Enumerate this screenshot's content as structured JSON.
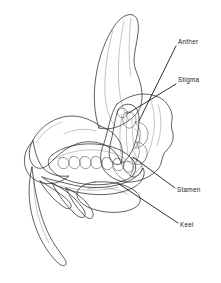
{
  "figure": {
    "background_color": "#ffffff",
    "width": 221,
    "height": 283,
    "style": "grayscale pen-and-ink botanical illustration"
  },
  "palette": {
    "ink": "#2b2b2b",
    "leader_line": "#0d0d0d",
    "label_text": "#1c1c1c",
    "light_gray": "#e8e8e8",
    "mid_gray": "#b9b9b9",
    "dark_gray": "#8a8a8a",
    "deep_gray": "#6a6a6a",
    "shadow_gray": "#4f4f4f",
    "paper": "#ffffff"
  },
  "labels": [
    {
      "id": "anther",
      "text": "Anther",
      "text_x": 178,
      "text_y": 44,
      "leader_from_x": 176,
      "leader_from_y": 46,
      "leader_to_x": 139,
      "leader_to_y": 121
    },
    {
      "id": "stigma",
      "text": "Stigma",
      "text_x": 178,
      "text_y": 82,
      "leader_from_x": 176,
      "leader_from_y": 84,
      "leader_to_x": 127,
      "leader_to_y": 114
    },
    {
      "id": "stamen",
      "text": "Stamen",
      "text_x": 177,
      "text_y": 192,
      "leader_from_x": 175,
      "leader_from_y": 188,
      "leader_to_x": 133,
      "leader_to_y": 157
    },
    {
      "id": "keel",
      "text": "Keel",
      "text_x": 180,
      "text_y": 227,
      "leader_from_x": 178,
      "leader_from_y": 223,
      "leader_to_x": 119,
      "leader_to_y": 184
    }
  ],
  "parts": [
    {
      "id": "banner-petal",
      "name": "banner petal"
    },
    {
      "id": "wing-petal",
      "name": "wing petal"
    },
    {
      "id": "keel-petal",
      "name": "keel petal"
    },
    {
      "id": "ovary",
      "name": "ovary with ovules"
    },
    {
      "id": "ovules",
      "name": "ovules",
      "count": 7
    },
    {
      "id": "stamen-column",
      "name": "stamen column"
    },
    {
      "id": "anther-head",
      "name": "anther"
    },
    {
      "id": "stigma-tip",
      "name": "stigma"
    },
    {
      "id": "calyx-tendrils",
      "name": "calyx lobes and pedicel",
      "count": 4
    }
  ]
}
